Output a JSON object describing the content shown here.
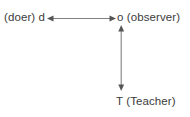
{
  "diagram": {
    "type": "triadic-relationship-diagram",
    "background_color": "#ffffff",
    "line_color": "#808080",
    "text_color": "#3b3b3b",
    "nodes": [
      {
        "id": "doer",
        "label": "(doer) d",
        "position": "left"
      },
      {
        "id": "observer",
        "label": "o (observer)",
        "position": "top-right"
      },
      {
        "id": "teacher",
        "label": "T (Teacher)",
        "position": "bottom-right"
      }
    ],
    "connectors": [
      {
        "id": "doer-observer",
        "from": "doer",
        "to": "observer",
        "orientation": "horizontal",
        "arrowheads": "both",
        "icon": "double-arrow-horizontal-icon"
      },
      {
        "id": "observer-teacher",
        "from": "teacher",
        "to": "observer",
        "orientation": "vertical",
        "arrowheads": "both",
        "icon": "double-arrow-vertical-icon"
      }
    ]
  }
}
